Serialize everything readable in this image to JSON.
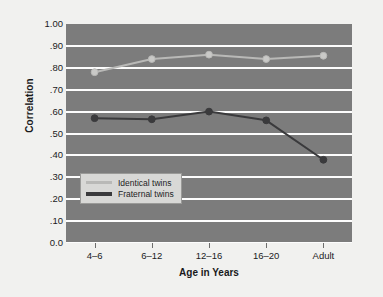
{
  "chart_data": {
    "type": "line",
    "title": "",
    "xlabel": "Age in Years",
    "ylabel": "Correlation",
    "categories": [
      "4–6",
      "6–12",
      "12–16",
      "16–20",
      "Adult"
    ],
    "ylim": [
      0.0,
      1.0
    ],
    "ytick_labels": [
      "1.00",
      ".90",
      ".80",
      ".70",
      ".60",
      ".50",
      ".40",
      ".30",
      ".20",
      ".10",
      "0.0"
    ],
    "ytick_values": [
      1.0,
      0.9,
      0.8,
      0.7,
      0.6,
      0.5,
      0.4,
      0.3,
      0.2,
      0.1,
      0.0
    ],
    "grid": true,
    "legend_position": "lower-left-inside",
    "series": [
      {
        "name": "Identical twins",
        "color": "#b9b9b7",
        "marker_color": "#c9c9c7",
        "values": [
          0.78,
          0.84,
          0.86,
          0.84,
          0.855
        ]
      },
      {
        "name": "Fraternal twins",
        "color": "#3a3a3c",
        "marker_color": "#3a3a3c",
        "values": [
          0.57,
          0.565,
          0.6,
          0.56,
          0.38
        ]
      }
    ],
    "plot_background": "#7c7c7c",
    "gridline_color": "#fdfdfd",
    "figure_background": "#f1f1ef"
  },
  "legend": {
    "entries": [
      {
        "label": "Identical twins"
      },
      {
        "label": "Fraternal twins"
      }
    ]
  }
}
